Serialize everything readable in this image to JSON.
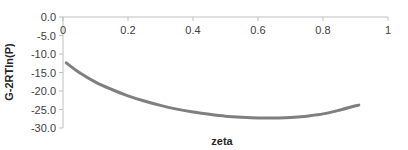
{
  "chart_data": {
    "type": "line",
    "title": "",
    "xlabel": "zeta",
    "ylabel": "G-2RTln(P)",
    "xlim": [
      0,
      1
    ],
    "ylim": [
      -30,
      0
    ],
    "x_ticks": [
      "0",
      "0.2",
      "0.4",
      "0.6",
      "0.8",
      "1"
    ],
    "y_ticks": [
      "0.0",
      "-5.0",
      "-10.0",
      "-15.0",
      "-20.0",
      "-25.0",
      "-30.0"
    ],
    "grid": false,
    "legend": null,
    "x_axis_position": "top",
    "series": [
      {
        "name": "G-2RTln(P)",
        "color": "#7f7f7f",
        "x": [
          0.01,
          0.05,
          0.1,
          0.15,
          0.2,
          0.25,
          0.3,
          0.35,
          0.4,
          0.45,
          0.5,
          0.55,
          0.6,
          0.65,
          0.7,
          0.75,
          0.8,
          0.85,
          0.9,
          0.91
        ],
        "values": [
          -12.4,
          -15.0,
          -17.6,
          -19.6,
          -21.3,
          -22.7,
          -23.9,
          -24.9,
          -25.7,
          -26.3,
          -26.8,
          -27.1,
          -27.3,
          -27.3,
          -27.2,
          -26.8,
          -26.2,
          -25.2,
          -24.0,
          -23.8
        ]
      }
    ]
  }
}
